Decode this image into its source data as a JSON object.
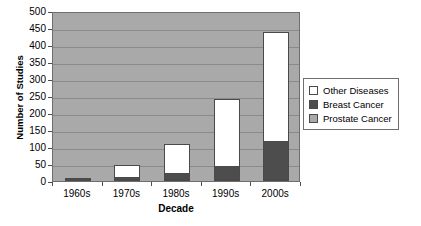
{
  "chart_data": {
    "type": "bar",
    "subtype": "stacked-bar",
    "title": "",
    "xlabel": "Decade",
    "ylabel": "Number of Studies",
    "categories": [
      "1960s",
      "1970s",
      "1980s",
      "1990s",
      "2000s"
    ],
    "ylim": [
      0,
      500
    ],
    "ytick_values": [
      0,
      50,
      100,
      150,
      200,
      250,
      300,
      350,
      400,
      450,
      500
    ],
    "ytick_labels": [
      "0",
      "50",
      "100",
      "150",
      "200",
      "250",
      "300",
      "350",
      "400",
      "450",
      "500"
    ],
    "grid": true,
    "grid_axis": "y",
    "legend_position": "right",
    "stack_order_bottom_to_top": [
      "Prostate Cancer",
      "Breast Cancer",
      "Other Diseases"
    ],
    "series": [
      {
        "name": "Prostate Cancer",
        "color": "#a9a9a9",
        "values": [
          2,
          2,
          3,
          4,
          6
        ]
      },
      {
        "name": "Breast Cancer",
        "color": "#4d4d4d",
        "values": [
          1,
          9,
          22,
          42,
          115
        ]
      },
      {
        "name": "Other Diseases",
        "color": "#ffffff",
        "values": [
          5,
          37,
          88,
          199,
          324
        ]
      }
    ],
    "totals": [
      8,
      48,
      113,
      245,
      445
    ],
    "plot_background": "#a9a9a9",
    "gridline_color": "#8a8a8a",
    "border_color": "#6e6e6e"
  },
  "legend": {
    "items": [
      {
        "label": "Other Diseases",
        "color": "#ffffff"
      },
      {
        "label": "Breast Cancer",
        "color": "#4d4d4d"
      },
      {
        "label": "Prostate Cancer",
        "color": "#a9a9a9"
      }
    ]
  },
  "axes": {
    "x_title": "Decade",
    "y_title": "Number of Studies"
  }
}
